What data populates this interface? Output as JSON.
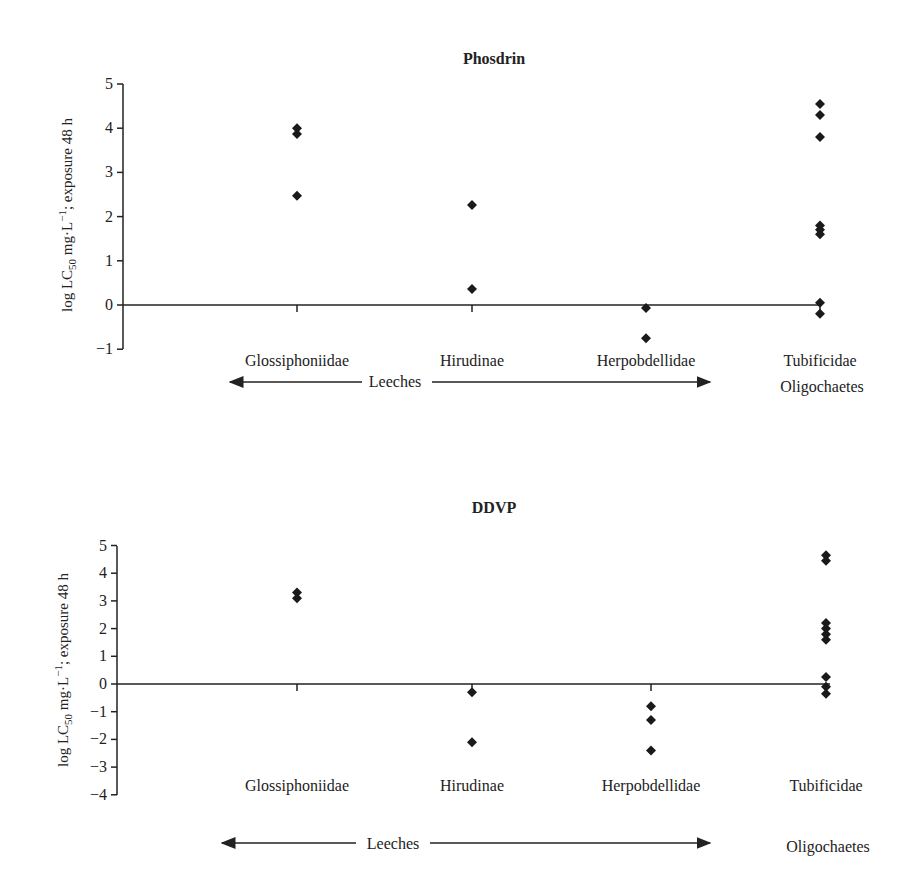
{
  "chart_data": [
    {
      "type": "scatter",
      "title": "Phosdrin",
      "xlabel": "",
      "ylabel": "log LC50 mg·L−1; exposure 48 h",
      "ylim": [
        -1,
        5
      ],
      "yticks": [
        "5",
        "4",
        "3",
        "2",
        "1",
        "0",
        "-1"
      ],
      "grid": false,
      "categories": [
        "Glossiphoniidae",
        "Hirudinae",
        "Herpobdellidae",
        "Tubificidae"
      ],
      "groups": [
        {
          "label": "Leeches",
          "span": [
            "Glossiphoniidae",
            "Herpobdellidae"
          ]
        },
        {
          "label": "Oligochaetes",
          "span": [
            "Tubificidae"
          ]
        }
      ],
      "series": [
        {
          "name": "Glossiphoniidae",
          "values": [
            4.0,
            3.87,
            2.47
          ]
        },
        {
          "name": "Hirudinae",
          "values": [
            2.26,
            0.36
          ]
        },
        {
          "name": "Herpobdellidae",
          "values": [
            -0.07,
            -0.75
          ]
        },
        {
          "name": "Tubificidae",
          "values": [
            4.55,
            4.3,
            3.8,
            1.8,
            1.7,
            1.6,
            0.05,
            -0.2
          ]
        }
      ]
    },
    {
      "type": "scatter",
      "title": "DDVP",
      "xlabel": "",
      "ylabel": "log LC50 mg·L−1; exposure 48 h",
      "ylim": [
        -4,
        5
      ],
      "yticks": [
        "5",
        "4",
        "3",
        "2",
        "1",
        "0",
        "-1",
        "-2",
        "-3",
        "-4"
      ],
      "grid": false,
      "categories": [
        "Glossiphoniidae",
        "Hirudinae",
        "Herpobdellidae",
        "Tubificidae"
      ],
      "groups": [
        {
          "label": "Leeches",
          "span": [
            "Glossiphoniidae",
            "Herpobdellidae"
          ]
        },
        {
          "label": "Oligochaetes",
          "span": [
            "Tubificidae"
          ]
        }
      ],
      "series": [
        {
          "name": "Glossiphoniidae",
          "values": [
            3.3,
            3.1
          ]
        },
        {
          "name": "Hirudinae",
          "values": [
            -0.3,
            -2.1
          ]
        },
        {
          "name": "Herpobdellidae",
          "values": [
            -0.8,
            -1.3,
            -2.4
          ]
        },
        {
          "name": "Tubificidae",
          "values": [
            4.65,
            4.45,
            2.2,
            2.0,
            1.8,
            1.6,
            0.25,
            -0.1,
            -0.35
          ]
        }
      ]
    }
  ],
  "charts": [
    {
      "title": "Phosdrin",
      "ylabel_main": "log LC",
      "ylabel_sub": "50",
      "ylabel_rest": " mg·L",
      "ylabel_sup": "−1",
      "ylabel_end": "; exposure 48 h",
      "categories": [
        "Glossiphoniidae",
        "Hirudinae",
        "Herpobdellidae",
        "Tubificidae"
      ],
      "group_leeches": "Leeches",
      "group_oligo": "Oligochaetes"
    },
    {
      "title": "DDVP",
      "ylabel_main": "log LC",
      "ylabel_sub": "50",
      "ylabel_rest": " mg·L",
      "ylabel_sup": "−1",
      "ylabel_end": "; exposure 48 h",
      "categories": [
        "Glossiphoniidae",
        "Hirudinae",
        "Herpobdellidae",
        "Tubificidae"
      ],
      "group_leeches": "Leeches",
      "group_oligo": "Oligochaetes"
    }
  ],
  "colors": {
    "marker": "#1a1a1a",
    "axis": "#222222"
  }
}
